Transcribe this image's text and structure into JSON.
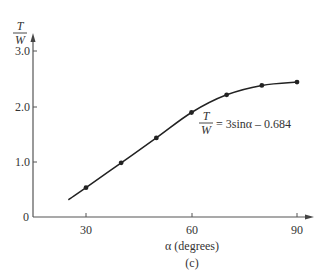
{
  "chart_data": {
    "type": "line",
    "title": "",
    "subtitle": "",
    "caption": "(c)",
    "xlabel": "α (degrees)",
    "ylabel": {
      "numerator": "T",
      "denominator": "W"
    },
    "x_ticks": [
      "30",
      "60",
      "90"
    ],
    "y_ticks": [
      "0",
      "1.0",
      "2.0",
      "3.0"
    ],
    "xlim": [
      12,
      96
    ],
    "ylim": [
      0,
      3.2
    ],
    "grid": false,
    "legend": null,
    "annotation": {
      "numerator": "T",
      "denominator": "W",
      "rhs": "= 3sinα – 0.684"
    },
    "series": [
      {
        "name": "T/W",
        "x": [
          30,
          40,
          50,
          60,
          70,
          80,
          90
        ],
        "y": [
          0.53,
          0.98,
          1.43,
          1.89,
          2.21,
          2.38,
          2.44
        ]
      }
    ],
    "curve_start": {
      "x": 25,
      "y": 0.31
    },
    "color": "#222222"
  }
}
